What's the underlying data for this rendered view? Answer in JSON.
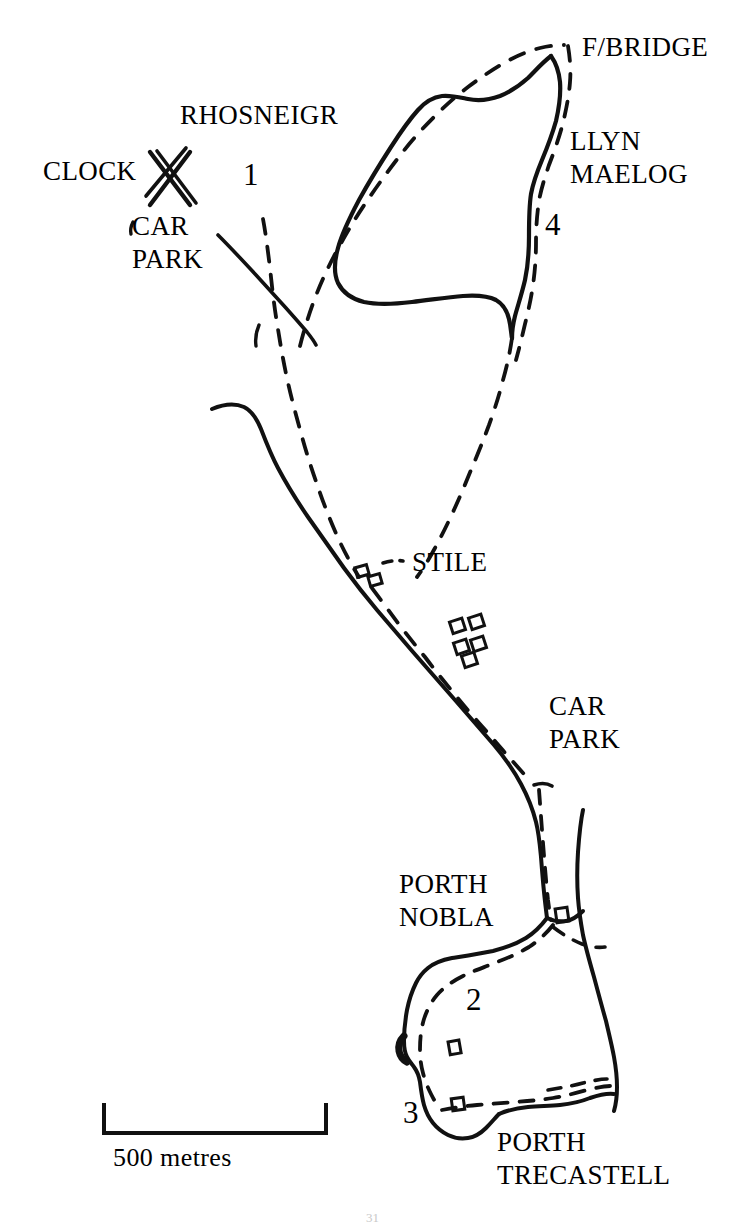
{
  "map": {
    "title": "Rhosneigr to Porth Trecastell coastal walk map",
    "scale_bar": {
      "label": "500 metres",
      "length_px": 222
    },
    "page_number": "31",
    "colors": {
      "ink": "#000000",
      "paper": "#ffffff"
    },
    "labels": [
      {
        "id": "rhosneigr",
        "text": "RHOSNEIGR",
        "x": 180,
        "y": 112,
        "kind": "place"
      },
      {
        "id": "clock",
        "text": "CLOCK",
        "x": 43,
        "y": 166,
        "kind": "place"
      },
      {
        "id": "car-park-north",
        "text": "CAR\nPARK",
        "x": 132,
        "y": 220,
        "kind": "place"
      },
      {
        "id": "f-bridge",
        "text": "F/BRIDGE",
        "x": 582,
        "y": 41,
        "kind": "place"
      },
      {
        "id": "llyn-maelog",
        "text": "LLYN\nMAELOG",
        "x": 570,
        "y": 133,
        "kind": "place"
      },
      {
        "id": "stile",
        "text": "STILE",
        "x": 412,
        "y": 556,
        "kind": "place"
      },
      {
        "id": "car-park-south",
        "text": "CAR\nPARK",
        "x": 549,
        "y": 700,
        "kind": "place"
      },
      {
        "id": "porth-nobla",
        "text": "PORTH\nNOBLA",
        "x": 399,
        "y": 878,
        "kind": "place"
      },
      {
        "id": "porth-trecastell",
        "text": "PORTH\nTRECASTELL",
        "x": 497,
        "y": 1136,
        "kind": "place"
      }
    ],
    "route_numbers": [
      {
        "id": "route-1",
        "text": "1",
        "x": 243,
        "y": 170
      },
      {
        "id": "route-4",
        "text": "4",
        "x": 545,
        "y": 220
      },
      {
        "id": "route-2",
        "text": "2",
        "x": 466,
        "y": 995
      },
      {
        "id": "route-3",
        "text": "3",
        "x": 403,
        "y": 1108
      }
    ],
    "legend_features": [
      {
        "name": "coastline",
        "style": "solid-line"
      },
      {
        "name": "footpath",
        "style": "dashed-line"
      },
      {
        "name": "lake",
        "style": "closed-solid-outline"
      },
      {
        "name": "road",
        "style": "solid-line"
      },
      {
        "name": "clock-mark",
        "style": "x-cross"
      },
      {
        "name": "buildings",
        "style": "small-rectangles"
      }
    ]
  }
}
